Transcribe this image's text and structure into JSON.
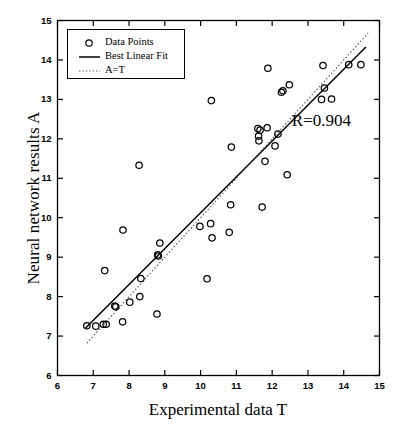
{
  "chart_data": {
    "type": "scatter",
    "title": "",
    "xlabel": "Experimental data T",
    "ylabel": "Neural network results A",
    "xlim": [
      6,
      15
    ],
    "ylim": [
      6,
      15
    ],
    "xticks": [
      6,
      7,
      8,
      9,
      10,
      11,
      12,
      13,
      14,
      15
    ],
    "yticks": [
      6,
      7,
      8,
      9,
      10,
      11,
      12,
      13,
      14,
      15
    ],
    "xticklabels": [
      "6",
      "7",
      "8",
      "9",
      "10",
      "11",
      "12",
      "13",
      "14",
      "15"
    ],
    "yticklabels": [
      "6",
      "7",
      "8",
      "9",
      "10",
      "11",
      "12",
      "13",
      "14",
      "15"
    ],
    "grid": false,
    "legend_position": "upper left",
    "marker": "open-circle",
    "marker_color": "#000000",
    "annotations": [
      {
        "text": "R=0.904",
        "x": 12.55,
        "y": 12.42
      }
    ],
    "legend": [
      {
        "label": "Data Points",
        "key": "marker"
      },
      {
        "label": "Best Linear Fit",
        "key": "solid-line"
      },
      {
        "label": "A=T",
        "key": "dotted-line"
      }
    ],
    "series": [
      {
        "name": "Data Points",
        "type": "scatter",
        "points": [
          [
            6.82,
            7.26
          ],
          [
            7.07,
            7.25
          ],
          [
            7.28,
            7.3
          ],
          [
            7.36,
            7.3
          ],
          [
            7.32,
            8.66
          ],
          [
            7.6,
            7.76
          ],
          [
            7.63,
            7.74
          ],
          [
            7.82,
            7.36
          ],
          [
            7.83,
            9.69
          ],
          [
            8.02,
            7.86
          ],
          [
            8.3,
            8.0
          ],
          [
            8.33,
            8.46
          ],
          [
            8.28,
            11.33
          ],
          [
            8.78,
            7.56
          ],
          [
            8.8,
            9.06
          ],
          [
            8.82,
            9.03
          ],
          [
            8.86,
            9.36
          ],
          [
            9.98,
            9.78
          ],
          [
            10.18,
            8.45
          ],
          [
            10.28,
            9.85
          ],
          [
            10.3,
            12.97
          ],
          [
            10.32,
            9.49
          ],
          [
            10.8,
            9.63
          ],
          [
            10.84,
            10.33
          ],
          [
            10.86,
            11.79
          ],
          [
            11.6,
            12.26
          ],
          [
            11.62,
            12.07
          ],
          [
            11.63,
            11.95
          ],
          [
            11.66,
            12.22
          ],
          [
            11.72,
            10.27
          ],
          [
            11.8,
            11.43
          ],
          [
            11.86,
            12.28
          ],
          [
            11.88,
            13.79
          ],
          [
            12.08,
            11.82
          ],
          [
            12.16,
            12.12
          ],
          [
            12.26,
            13.18
          ],
          [
            12.3,
            13.22
          ],
          [
            12.42,
            11.09
          ],
          [
            12.48,
            13.37
          ],
          [
            13.38,
            13.0
          ],
          [
            13.42,
            13.86
          ],
          [
            13.46,
            13.29
          ],
          [
            13.66,
            13.01
          ],
          [
            14.14,
            13.88
          ],
          [
            14.48,
            13.88
          ]
        ]
      },
      {
        "name": "Best Linear Fit",
        "type": "line",
        "style": "solid",
        "endpoints": [
          [
            6.78,
            7.2
          ],
          [
            14.62,
            14.33
          ]
        ],
        "slope": 0.909,
        "intercept": 1.039
      },
      {
        "name": "A=T",
        "type": "line",
        "style": "dotted",
        "endpoints": [
          [
            6.82,
            6.82
          ],
          [
            14.68,
            14.68
          ]
        ],
        "slope": 1.0,
        "intercept": 0.0
      }
    ]
  },
  "figure": {
    "background": "#ffffff",
    "axis_color": "#000000",
    "marker_color": "#000000",
    "fit_line_color": "#000000",
    "identity_line_color": "#555555"
  }
}
